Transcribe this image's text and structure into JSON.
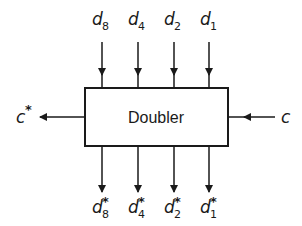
{
  "diagram": {
    "block": {
      "label": "Doubler",
      "x": 85,
      "y": 88,
      "width": 143,
      "height": 58
    },
    "inputs_top": [
      {
        "base": "d",
        "sub": "8",
        "x": 102
      },
      {
        "base": "d",
        "sub": "4",
        "x": 138
      },
      {
        "base": "d",
        "sub": "2",
        "x": 174
      },
      {
        "base": "d",
        "sub": "1",
        "x": 209
      }
    ],
    "outputs_bottom": [
      {
        "base": "d",
        "sub": "8",
        "star": "*",
        "x": 102
      },
      {
        "base": "d",
        "sub": "4",
        "star": "*",
        "x": 138
      },
      {
        "base": "d",
        "sub": "2",
        "star": "*",
        "x": 174
      },
      {
        "base": "d",
        "sub": "1",
        "star": "*",
        "x": 209
      }
    ],
    "carry_in": {
      "label": "c"
    },
    "carry_out": {
      "label": "c",
      "star": "*"
    },
    "colors": {
      "stroke": "#1a1a1a",
      "background": "#ffffff"
    }
  }
}
